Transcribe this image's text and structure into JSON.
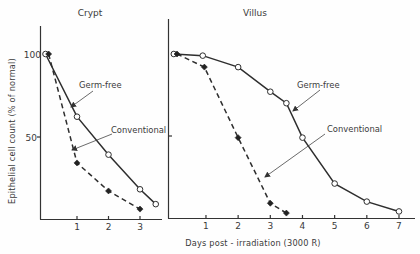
{
  "figure": {
    "y_axis_label": "Epithelial cell count (% of normal)",
    "x_axis_label": "Days post - irradiation (3000 R)"
  },
  "panels": {
    "crypt": {
      "title": "Crypt",
      "y_ticks": [
        "100",
        "50"
      ],
      "x_ticks": [
        "1",
        "2",
        "3"
      ],
      "annotations": {
        "germ_free": "Germ-free",
        "conventional": "Conventional"
      }
    },
    "villus": {
      "title": "Villus",
      "x_ticks": [
        "1",
        "2",
        "3",
        "4",
        "5",
        "6",
        "7"
      ],
      "annotations": {
        "germ_free": "Germ-free",
        "conventional": "Conventional"
      }
    }
  },
  "colors": {
    "line": "#2e2e2e",
    "background": "#fefefe"
  },
  "chart_data": [
    {
      "type": "line",
      "title": "Crypt",
      "xlabel": "Days post-irradiation (3000 R)",
      "ylabel": "Epithelial cell count (% of normal)",
      "xlim": [
        0,
        3.6
      ],
      "ylim": [
        0,
        105
      ],
      "x_ticks": [
        1,
        2,
        3
      ],
      "y_ticks": [
        50,
        100
      ],
      "grid": false,
      "legend": "inline annotations with arrows",
      "series": [
        {
          "name": "Germ-free",
          "style": "solid",
          "marker": "open-circle",
          "x": [
            0,
            1,
            2,
            3,
            3.5
          ],
          "values": [
            100,
            62,
            39,
            18,
            9
          ]
        },
        {
          "name": "Conventional",
          "style": "dashed",
          "marker": "filled-diamond",
          "x": [
            0.1,
            1,
            2,
            3
          ],
          "values": [
            100,
            34,
            17,
            6
          ]
        }
      ]
    },
    {
      "type": "line",
      "title": "Villus",
      "xlabel": "Days post-irradiation (3000 R)",
      "ylabel": "Epithelial cell count (% of normal)",
      "xlim": [
        0,
        7.5
      ],
      "ylim": [
        0,
        105
      ],
      "x_ticks": [
        1,
        2,
        3,
        4,
        5,
        6,
        7
      ],
      "y_ticks": [
        50
      ],
      "grid": false,
      "legend": "inline annotations with arrows",
      "series": [
        {
          "name": "Germ-free",
          "style": "solid",
          "marker": "open-circle",
          "x": [
            0,
            0.9,
            2,
            3,
            3.5,
            4,
            5,
            6,
            7
          ],
          "values": [
            100,
            99,
            92,
            77,
            70,
            49,
            21,
            10,
            4
          ]
        },
        {
          "name": "Conventional",
          "style": "dashed",
          "marker": "filled-diamond",
          "x": [
            0.1,
            0.95,
            2,
            3,
            3.5
          ],
          "values": [
            100,
            92,
            49,
            9,
            3
          ]
        }
      ]
    }
  ]
}
